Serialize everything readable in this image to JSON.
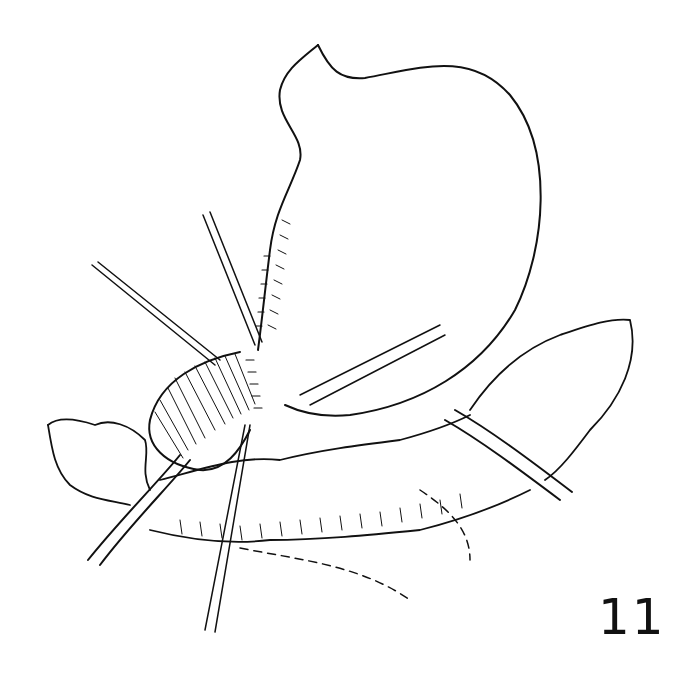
{
  "figure": {
    "label": "11",
    "style": "black ink line drawing on white"
  },
  "colors": {
    "background": "#ffffff",
    "ink": "#111111"
  }
}
